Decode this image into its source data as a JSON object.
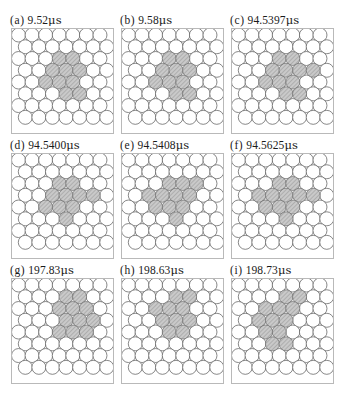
{
  "figure": {
    "title": "",
    "background_color": "#ffffff",
    "layout": {
      "rows": 3,
      "cols": 3
    }
  },
  "style": {
    "circle_fill": "#ffffff",
    "circle_stroke": "#555555",
    "highlight_fill": "#c9c9c9",
    "highlight_stroke": "#6a6a6a",
    "hatch_color": "#8f8f8f",
    "frame_color": "#b9b9b9",
    "label_color": "#1a1a1a",
    "unit": "μs"
  },
  "panels": [
    {
      "id": "a",
      "label_id": "(a)",
      "time_value": "9.52",
      "unit": "μs",
      "label_full": "(a)  9.52 μs",
      "lattice": {
        "cols": 7,
        "rows": 8,
        "packing": "hexagonal"
      },
      "highlight_count": 10,
      "highlight_cells": [
        [
          3,
          2
        ],
        [
          4,
          2
        ],
        [
          2,
          3
        ],
        [
          3,
          3
        ],
        [
          4,
          3
        ],
        [
          2,
          4
        ],
        [
          3,
          4
        ],
        [
          4,
          4
        ],
        [
          3,
          5
        ],
        [
          4,
          5
        ]
      ]
    },
    {
      "id": "b",
      "label_id": "(b)",
      "time_value": "9.58",
      "unit": "μs",
      "label_full": "(b)  9.58 μs",
      "lattice": {
        "cols": 7,
        "rows": 8,
        "packing": "hexagonal"
      },
      "highlight_count": 10,
      "highlight_cells": [
        [
          3,
          2
        ],
        [
          4,
          2
        ],
        [
          2,
          3
        ],
        [
          3,
          3
        ],
        [
          4,
          3
        ],
        [
          2,
          4
        ],
        [
          3,
          4
        ],
        [
          4,
          4
        ],
        [
          3,
          5
        ],
        [
          4,
          5
        ]
      ]
    },
    {
      "id": "c",
      "label_id": "(c)",
      "time_value": "94.5397",
      "unit": "μs",
      "label_full": "(c)  94.5397 μs",
      "lattice": {
        "cols": 7,
        "rows": 8,
        "packing": "hexagonal"
      },
      "highlight_count": 11,
      "highlight_cells": [
        [
          3,
          2
        ],
        [
          4,
          2
        ],
        [
          2,
          3
        ],
        [
          3,
          3
        ],
        [
          4,
          3
        ],
        [
          5,
          3
        ],
        [
          2,
          4
        ],
        [
          3,
          4
        ],
        [
          4,
          4
        ],
        [
          3,
          5
        ],
        [
          4,
          5
        ]
      ]
    },
    {
      "id": "d",
      "label_id": "(d)",
      "time_value": "94.5400",
      "unit": "μs",
      "label_full": "(d) 94.5400 μs",
      "lattice": {
        "cols": 7,
        "rows": 8,
        "packing": "hexagonal"
      },
      "highlight_count": 10,
      "highlight_cells": [
        [
          3,
          2
        ],
        [
          4,
          2
        ],
        [
          2,
          3
        ],
        [
          3,
          3
        ],
        [
          4,
          3
        ],
        [
          5,
          3
        ],
        [
          2,
          4
        ],
        [
          3,
          4
        ],
        [
          4,
          4
        ],
        [
          3,
          5
        ]
      ]
    },
    {
      "id": "e",
      "label_id": "(e)",
      "time_value": "94.5408",
      "unit": "μs",
      "label_full": "(e) 94.5408 μs",
      "lattice": {
        "cols": 7,
        "rows": 8,
        "packing": "hexagonal"
      },
      "highlight_count": 11,
      "highlight_cells": [
        [
          3,
          2
        ],
        [
          4,
          2
        ],
        [
          5,
          2
        ],
        [
          1,
          3
        ],
        [
          2,
          3
        ],
        [
          3,
          3
        ],
        [
          4,
          3
        ],
        [
          2,
          4
        ],
        [
          3,
          4
        ],
        [
          4,
          4
        ],
        [
          3,
          5
        ]
      ]
    },
    {
      "id": "f",
      "label_id": "(f)",
      "time_value": "94.5625",
      "unit": "μs",
      "label_full": "(f) 94.5625 μs",
      "lattice": {
        "cols": 7,
        "rows": 8,
        "packing": "hexagonal"
      },
      "highlight_count": 11,
      "highlight_cells": [
        [
          3,
          2
        ],
        [
          4,
          2
        ],
        [
          1,
          3
        ],
        [
          2,
          3
        ],
        [
          3,
          3
        ],
        [
          4,
          3
        ],
        [
          5,
          3
        ],
        [
          2,
          4
        ],
        [
          3,
          4
        ],
        [
          4,
          4
        ],
        [
          3,
          5
        ]
      ]
    },
    {
      "id": "g",
      "label_id": "(g)",
      "time_value": "197.83",
      "unit": "μs",
      "label_full": "(g) 197.83 μs",
      "lattice": {
        "cols": 7,
        "rows": 8,
        "packing": "hexagonal"
      },
      "highlight_count": 11,
      "highlight_cells": [
        [
          3,
          1
        ],
        [
          4,
          1
        ],
        [
          3,
          2
        ],
        [
          4,
          2
        ],
        [
          5,
          2
        ],
        [
          3,
          3
        ],
        [
          4,
          3
        ],
        [
          5,
          3
        ],
        [
          3,
          4
        ],
        [
          4,
          4
        ],
        [
          5,
          4
        ]
      ]
    },
    {
      "id": "h",
      "label_id": "(h)",
      "time_value": "198.63",
      "unit": "μs",
      "label_full": "(h) 198.63 μs",
      "lattice": {
        "cols": 7,
        "rows": 8,
        "packing": "hexagonal"
      },
      "highlight_count": 11,
      "highlight_cells": [
        [
          3,
          1
        ],
        [
          4,
          1
        ],
        [
          2,
          2
        ],
        [
          3,
          2
        ],
        [
          4,
          2
        ],
        [
          2,
          3
        ],
        [
          3,
          3
        ],
        [
          4,
          3
        ],
        [
          3,
          4
        ],
        [
          4,
          4
        ]
      ]
    },
    {
      "id": "i",
      "label_id": "(i)",
      "time_value": "198.73",
      "unit": "μs",
      "label_full": "(i) 198.73 μs",
      "lattice": {
        "cols": 7,
        "rows": 8,
        "packing": "hexagonal"
      },
      "highlight_count": 12,
      "highlight_cells": [
        [
          3,
          1
        ],
        [
          4,
          1
        ],
        [
          2,
          2
        ],
        [
          3,
          2
        ],
        [
          4,
          2
        ],
        [
          1,
          3
        ],
        [
          2,
          3
        ],
        [
          3,
          3
        ],
        [
          2,
          4
        ],
        [
          3,
          4
        ],
        [
          2,
          5
        ],
        [
          3,
          5
        ]
      ]
    }
  ],
  "chart_data": {
    "type": "scatter",
    "title": "",
    "xlabel": "",
    "ylabel": "",
    "categories": [
      "(a)",
      "(b)",
      "(c)",
      "(d)",
      "(e)",
      "(f)",
      "(g)",
      "(h)",
      "(i)"
    ],
    "series": [
      {
        "name": "time (μs)",
        "values": [
          9.52,
          9.58,
          94.5397,
          94.54,
          94.5408,
          94.5625,
          197.83,
          198.63,
          198.73
        ]
      },
      {
        "name": "highlighted particle count",
        "values": [
          10,
          10,
          11,
          10,
          11,
          11,
          11,
          10,
          12
        ]
      }
    ],
    "legend_position": "none",
    "grid": false
  }
}
